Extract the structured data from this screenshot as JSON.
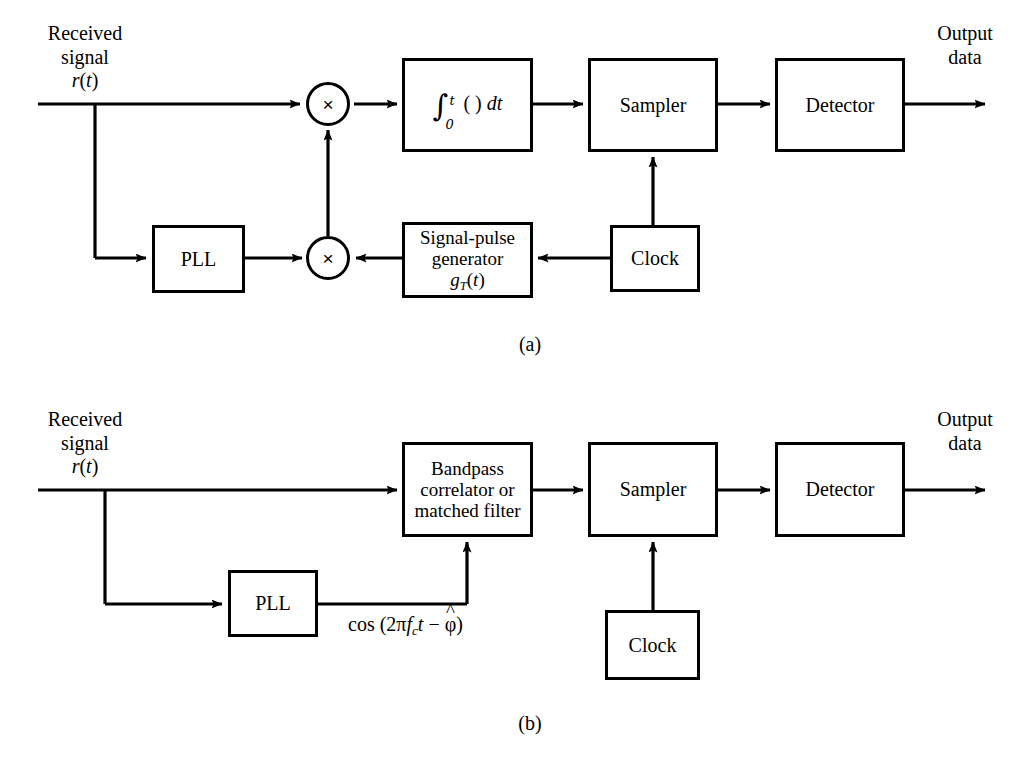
{
  "figure": {
    "panels": [
      {
        "caption": "(a)",
        "input_label_line1": "Received",
        "input_label_line2": "signal",
        "input_label_line3": "r(t)",
        "output_label_line1": "Output",
        "output_label_line2": "data",
        "blocks": {
          "integrator": "∫0t ( ) dt",
          "integrator_limit_upper": "t",
          "integrator_limit_lower": "0",
          "integrator_body": "( ) dt",
          "sampler": "Sampler",
          "detector": "Detector",
          "pll": "PLL",
          "generator_line1": "Signal-pulse",
          "generator_line2": "generator",
          "generator_line3": "gT(t)",
          "clock": "Clock"
        },
        "multiplier_symbol": "×"
      },
      {
        "caption": "(b)",
        "input_label_line1": "Received",
        "input_label_line2": "signal",
        "input_label_line3": "r(t)",
        "output_label_line1": "Output",
        "output_label_line2": "data",
        "blocks": {
          "correlator_line1": "Bandpass",
          "correlator_line2": "correlator or",
          "correlator_line3": "matched filter",
          "sampler": "Sampler",
          "detector": "Detector",
          "pll": "PLL",
          "clock": "Clock"
        },
        "carrier_expression": "cos (2πfct − φ̂)"
      }
    ],
    "colors": {
      "ink": "#000000",
      "paper": "#ffffff"
    }
  }
}
